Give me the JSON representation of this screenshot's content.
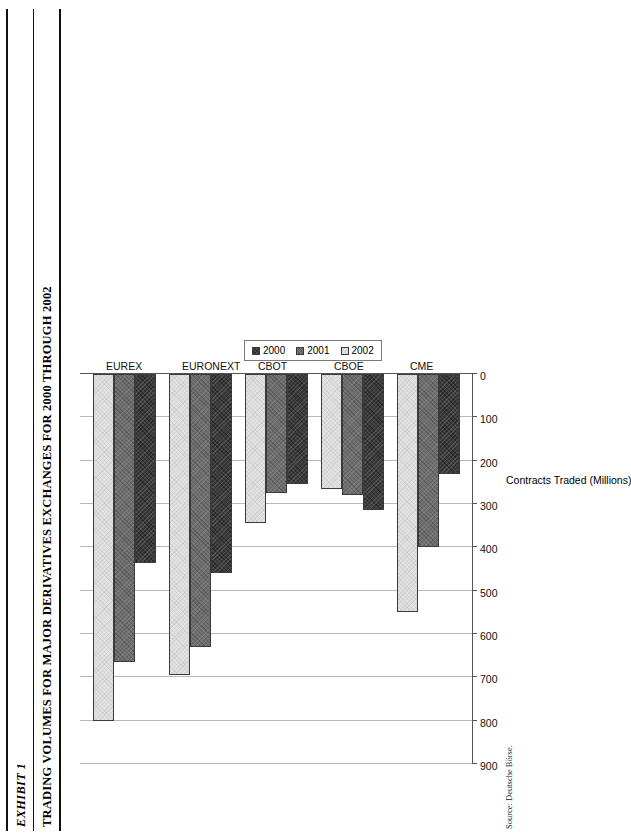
{
  "exhibit": {
    "number": "EXHIBIT 1",
    "title": "TRADING VOLUMES FOR MAJOR DERIVATIVES EXCHANGES FOR 2000 THROUGH 2002",
    "source": "Source: Deutsche Börse."
  },
  "legend": {
    "items": [
      {
        "label": "2000",
        "color": "#3b3b3b"
      },
      {
        "label": "2001",
        "color": "#6e6e6e"
      },
      {
        "label": "2002",
        "color": "#e2e2e2"
      }
    ]
  },
  "chart_data": {
    "type": "bar",
    "orientation": "horizontal",
    "title": "TRADING VOLUMES FOR MAJOR DERIVATIVES EXCHANGES FOR 2000 THROUGH 2002",
    "xlabel": "",
    "ylabel": "Contracts Traded (Millions)",
    "categories": [
      "EUREX",
      "EURONEXT",
      "CBOT",
      "CBOE",
      "CME"
    ],
    "series": [
      {
        "name": "2000",
        "values": [
          436,
          460,
          255,
          313,
          231
        ]
      },
      {
        "name": "2001",
        "values": [
          665,
          630,
          275,
          280,
          400
        ]
      },
      {
        "name": "2002",
        "values": [
          800,
          695,
          345,
          265,
          550
        ]
      }
    ],
    "axis_ticks": [
      900,
      800,
      700,
      600,
      500,
      400,
      300,
      200,
      100,
      0
    ],
    "ylim": [
      0,
      900
    ],
    "grid": true,
    "legend_position": "center-right"
  }
}
